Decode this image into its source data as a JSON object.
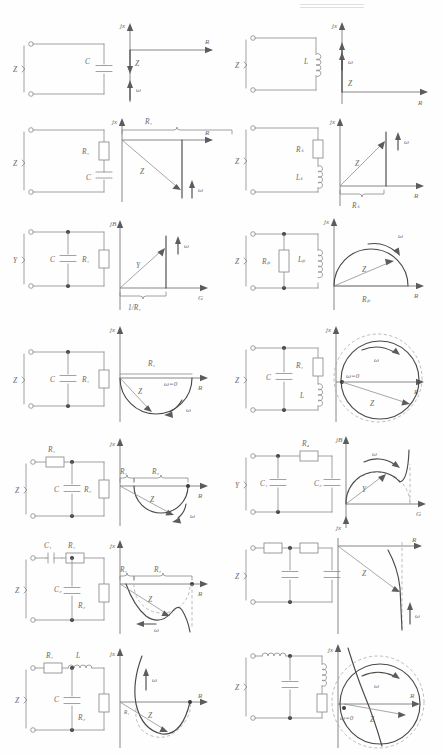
{
  "figure": {
    "columns": 2,
    "rows": 7,
    "axis_labels": {
      "imag_impedance": "jx",
      "real_impedance": "R",
      "imag_admittance": "jB",
      "real_admittance": "G"
    },
    "symbols": {
      "impedance": "Z",
      "admittance": "Y",
      "omega": "ω",
      "omega_zero": "ω=0",
      "resistor_1": "R₁",
      "resistor_2": "R₂",
      "resistor_4": "R₄",
      "resistor_series": "Rₛ",
      "resistor_parallel": "Rₚ",
      "inductor": "L",
      "inductor_series": "Lₛ",
      "inductor_parallel": "Lₚ",
      "capacitor": "C",
      "capacitor_1": "C₁",
      "capacitor_2": "C₂",
      "conductance_marker": "1/R₁"
    }
  },
  "cells": [
    {
      "id": "r1c1",
      "network": {
        "quantity": "Z",
        "description": "single capacitor",
        "elements": [
          "C"
        ]
      },
      "locus": {
        "type": "ray-negative-imaginary",
        "vertical_axis": "jx",
        "horizontal_axis": "R",
        "vectors": [
          "Z"
        ],
        "frequency_arrow": "ω",
        "labels": [
          "Z",
          "ω"
        ]
      }
    },
    {
      "id": "r1c2",
      "network": {
        "quantity": "Z",
        "description": "single inductor",
        "elements": [
          "L"
        ]
      },
      "locus": {
        "type": "ray-positive-imaginary",
        "vertical_axis": "jx",
        "horizontal_axis": "R",
        "vectors": [
          "Z"
        ],
        "frequency_arrow": "ω",
        "labels": [
          "Z",
          "ω"
        ]
      }
    },
    {
      "id": "r2c1",
      "network": {
        "quantity": "Z",
        "description": "resistor in series with capacitor",
        "elements": [
          "R₁",
          "C"
        ]
      },
      "locus": {
        "type": "vertical-line-downward",
        "vertical_axis": "jx",
        "horizontal_axis": "R",
        "vectors": [
          "Z"
        ],
        "bracket_label": "R₁",
        "frequency_arrow": "ω",
        "labels": [
          "R₁",
          "Z",
          "ω"
        ]
      }
    },
    {
      "id": "r2c2",
      "network": {
        "quantity": "Z",
        "description": "resistor in series with inductor",
        "elements": [
          "Rₛ",
          "Lₛ"
        ]
      },
      "locus": {
        "type": "vertical-line-upward",
        "vertical_axis": "jx",
        "horizontal_axis": "R",
        "vectors": [
          "Z"
        ],
        "bracket_label": "Rₛ",
        "frequency_arrow": "ω",
        "labels": [
          "Z",
          "ω",
          "Rₛ"
        ]
      }
    },
    {
      "id": "r3c1",
      "network": {
        "quantity": "Y",
        "description": "capacitor in parallel with resistor",
        "elements": [
          "C",
          "R₁"
        ]
      },
      "locus": {
        "type": "vertical-line-upward",
        "vertical_axis": "jB",
        "horizontal_axis": "G",
        "vectors": [
          "Y"
        ],
        "bracket_label": "1/R₁",
        "frequency_arrow": "ω",
        "labels": [
          "Y",
          "ω",
          "1/R₁"
        ]
      }
    },
    {
      "id": "r3c2",
      "network": {
        "quantity": "Z",
        "description": "resistor in parallel with inductor",
        "elements": [
          "Rₚ",
          "Lₚ"
        ]
      },
      "locus": {
        "type": "semicircle-upper",
        "vertical_axis": "jx",
        "horizontal_axis": "R",
        "vectors": [
          "Z"
        ],
        "bracket_label": "Rₚ",
        "frequency_arrow": "ω",
        "labels": [
          "ω",
          "Z",
          "Rₚ"
        ]
      }
    },
    {
      "id": "r4c1",
      "network": {
        "quantity": "Z",
        "description": "capacitor in parallel with resistor",
        "elements": [
          "C",
          "R₁"
        ]
      },
      "locus": {
        "type": "semicircle-lower",
        "vertical_axis": "jx",
        "horizontal_axis": "R",
        "vectors": [
          "Z"
        ],
        "bracket_label": "R₁",
        "start_marker": "ω=0",
        "frequency_arrow": "ω",
        "labels": [
          "R₁",
          "Z",
          "ω=0",
          "ω"
        ]
      }
    },
    {
      "id": "r4c2",
      "network": {
        "quantity": "Z",
        "description": "capacitor in parallel with series resistor and inductor",
        "elements": [
          "C",
          "R₁",
          "L"
        ]
      },
      "locus": {
        "type": "full-circle",
        "vertical_axis": "jx",
        "horizontal_axis": "R",
        "vectors": [
          "Z"
        ],
        "start_marker": "ω=0",
        "frequency_arrow": "ω",
        "labels": [
          "ω",
          "ω=0",
          "Z"
        ]
      }
    },
    {
      "id": "r5c1",
      "network": {
        "quantity": "Z",
        "description": "resistor in series with parallel capacitor and resistor",
        "elements": [
          "R₁",
          "C",
          "R₂"
        ]
      },
      "locus": {
        "type": "semicircle-lower-offset",
        "vertical_axis": "jx",
        "horizontal_axis": "R",
        "vectors": [
          "Z"
        ],
        "bracket_labels": [
          "R₁",
          "R₂"
        ],
        "frequency_arrow": "ω",
        "labels": [
          "R₁",
          "R₂",
          "Z",
          "ω"
        ]
      }
    },
    {
      "id": "r5c2",
      "network": {
        "quantity": "Y",
        "description": "capacitor in parallel with series resistor and capacitor",
        "elements": [
          "C₁",
          "R₄",
          "C₂"
        ]
      },
      "locus": {
        "type": "semicircle-upper-with-asymptote",
        "vertical_axis": "jB",
        "horizontal_axis": "G",
        "lower_axis": "jx",
        "vectors": [
          "Y"
        ],
        "frequency_arrow": "ω",
        "labels": [
          "ω",
          "Y"
        ]
      }
    },
    {
      "id": "r6c1",
      "network": {
        "quantity": "Z",
        "description": "series capacitor and resistor with parallel capacitor and resistor",
        "elements": [
          "C₁",
          "R₁",
          "C₂",
          "R₂"
        ]
      },
      "locus": {
        "type": "arc-with-tail",
        "vertical_axis": "jx",
        "horizontal_axis": "R",
        "vectors": [
          "Z"
        ],
        "bracket_labels": [
          "R₁",
          "R₂"
        ],
        "frequency_arrow": "ω",
        "labels": [
          "R₁",
          "R₂",
          "Z",
          "ω"
        ]
      }
    },
    {
      "id": "r6c2",
      "network": {
        "quantity": "Z",
        "description": "two-section resistor capacitor ladder network",
        "elements": [
          "R",
          "R",
          "C",
          "C"
        ]
      },
      "locus": {
        "type": "descending-curve",
        "vertical_axis": "jx",
        "horizontal_axis": "R",
        "vectors": [
          "Z"
        ],
        "frequency_arrow": "ω",
        "labels": [
          "Z",
          "ω"
        ]
      }
    },
    {
      "id": "r7c1",
      "network": {
        "quantity": "Z",
        "description": "resistor and inductor in series with parallel capacitor and resistor",
        "elements": [
          "R₁",
          "L",
          "C",
          "R₂"
        ]
      },
      "locus": {
        "type": "u-shaped-curve",
        "vertical_axis": "jx",
        "horizontal_axis": "R",
        "vectors": [
          "Z"
        ],
        "start_marker": "R₁",
        "frequency_arrow": "ω",
        "labels": [
          "ω",
          "R₁",
          "Z"
        ]
      }
    },
    {
      "id": "r7c2",
      "network": {
        "quantity": "Z",
        "description": "inductor with parallel capacitor and series inductor resistor branch",
        "elements": [
          "L",
          "C",
          "L",
          "R"
        ]
      },
      "locus": {
        "type": "circle-with-crossing-curve",
        "vertical_axis": "jx",
        "horizontal_axis": "R",
        "vectors": [
          "Z"
        ],
        "start_marker": "ω=0",
        "frequency_arrow": "ω",
        "labels": [
          "ω",
          "Z",
          "ω=0"
        ]
      }
    }
  ]
}
